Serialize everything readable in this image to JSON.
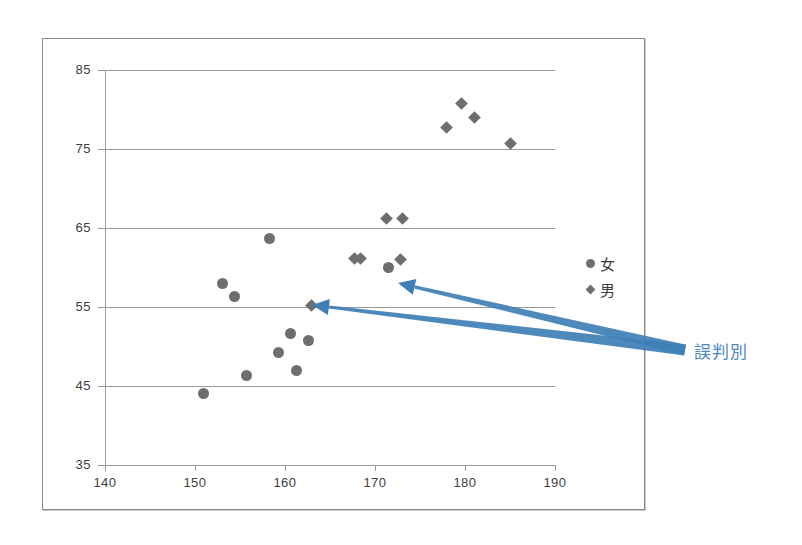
{
  "chart_data": {
    "type": "scatter",
    "title": "",
    "xlabel": "",
    "ylabel": "",
    "xlim": [
      140,
      190
    ],
    "ylim": [
      35,
      85
    ],
    "xticks": [
      140,
      150,
      160,
      170,
      180,
      190
    ],
    "yticks": [
      35,
      45,
      55,
      65,
      75,
      85
    ],
    "grid": "horizontal",
    "legend_position": "right",
    "series": [
      {
        "name": "女",
        "marker": "circle",
        "color": "#6e6e6e",
        "points": [
          [
            150.9,
            44.0
          ],
          [
            153.0,
            58.0
          ],
          [
            154.4,
            56.3
          ],
          [
            155.7,
            46.3
          ],
          [
            158.3,
            63.7
          ],
          [
            159.3,
            49.3
          ],
          [
            160.6,
            51.7
          ],
          [
            161.3,
            47.0
          ],
          [
            162.6,
            50.7
          ],
          [
            171.5,
            60.0
          ]
        ]
      },
      {
        "name": "男",
        "marker": "diamond",
        "color": "#6e6e6e",
        "points": [
          [
            162.9,
            55.2
          ],
          [
            167.7,
            61.2
          ],
          [
            168.4,
            61.2
          ],
          [
            171.3,
            66.2
          ],
          [
            172.8,
            61.0
          ],
          [
            173.1,
            66.2
          ],
          [
            177.9,
            77.7
          ],
          [
            179.6,
            80.8
          ],
          [
            181.1,
            79.0
          ],
          [
            185.0,
            75.7
          ]
        ]
      }
    ],
    "annotations": [
      {
        "text": "誤判別",
        "color": "#3f7fb5",
        "arrows": [
          {
            "from": [
              685,
              350
            ],
            "to": [
              398,
              283
            ]
          },
          {
            "from": [
              685,
              350
            ],
            "to": [
              312,
              305
            ]
          }
        ]
      }
    ]
  },
  "legend": {
    "items": [
      {
        "label": "女",
        "marker": "circle"
      },
      {
        "label": "男",
        "marker": "diamond"
      }
    ]
  },
  "annotation": {
    "label": "誤判別",
    "color": "#3f7fb5"
  },
  "axes": {
    "x_tick_labels": [
      "140",
      "150",
      "160",
      "170",
      "180",
      "190"
    ],
    "y_tick_labels": [
      "35",
      "45",
      "55",
      "65",
      "75",
      "85"
    ]
  },
  "colors": {
    "marker": "#6e6e6e",
    "grid": "#9a9a9a",
    "annotation": "#3f7fb5",
    "frame": "#8a8a8a"
  }
}
